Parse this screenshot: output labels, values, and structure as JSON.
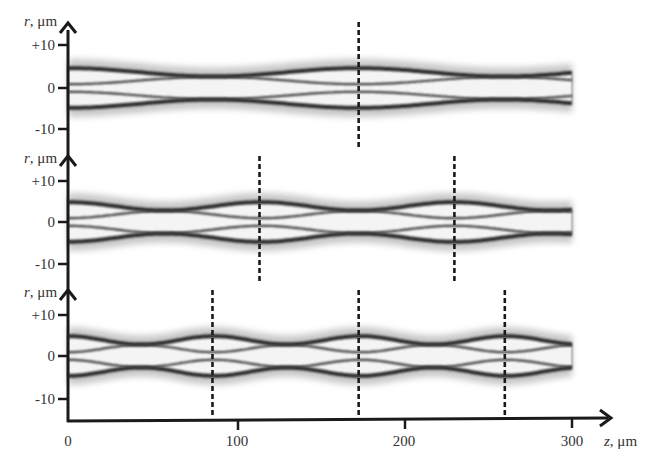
{
  "chart_data": {
    "type": "heatmap",
    "title": "",
    "xlabel": "z, μm",
    "ylabel": "r, μm",
    "xlim": [
      0,
      300
    ],
    "xticks": [
      0,
      100,
      200,
      300
    ],
    "x_tick_labels": [
      "0",
      "100",
      "200",
      "300"
    ],
    "grid": false,
    "legend": null,
    "panels": [
      {
        "id": 1,
        "ylabel": "r, μm",
        "ylim": [
          -15,
          12
        ],
        "yticks": [
          10,
          0,
          -10
        ],
        "y_tick_labels": [
          "+10",
          "0",
          "-10"
        ],
        "dashed_lines_z": [
          173
        ],
        "beam_half_width_um": 4,
        "period_um": 173
      },
      {
        "id": 2,
        "ylabel": "r, μm",
        "ylim": [
          -15,
          12
        ],
        "yticks": [
          10,
          0,
          -10
        ],
        "y_tick_labels": [
          "+10",
          "0",
          "-10"
        ],
        "dashed_lines_z": [
          114,
          230
        ],
        "beam_half_width_um": 4,
        "period_um": 115
      },
      {
        "id": 3,
        "ylabel": "r, μm",
        "ylim": [
          -15,
          12
        ],
        "yticks": [
          10,
          0,
          -10
        ],
        "y_tick_labels": [
          "+10",
          "0",
          "-10"
        ],
        "dashed_lines_z": [
          86,
          173,
          260
        ],
        "beam_half_width_um": 4,
        "period_um": 87
      }
    ]
  },
  "labels": {
    "r_axis": "r, μm",
    "r_italic": "r",
    "r_unit": ", μm",
    "z_italic": "z",
    "z_unit": ", μm",
    "ytick_plus10": "+10",
    "ytick_0": "0",
    "ytick_minus10": "-10",
    "xtick_0": "0",
    "xtick_100": "100",
    "xtick_200": "200",
    "xtick_300": "300"
  },
  "colors": {
    "axis": "#1a1a1a",
    "text": "#333333",
    "pattern_dark": "#1e1e1e",
    "background": "#ffffff"
  }
}
